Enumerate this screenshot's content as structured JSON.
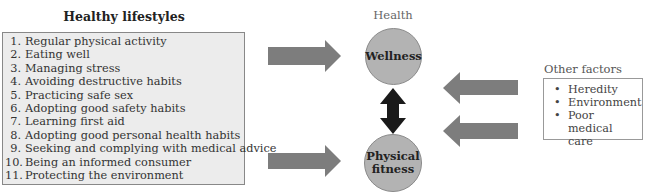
{
  "healthy_lifestyles": {
    "title": "Healthy lifestyles",
    "items": [
      {
        "num": "1.",
        "label": "Regular physical activity"
      },
      {
        "num": "2.",
        "label": "Eating well"
      },
      {
        "num": "3.",
        "label": "Managing stress"
      },
      {
        "num": "4.",
        "label": "Avoiding destructive habits"
      },
      {
        "num": "5.",
        "label": "Practicing safe sex"
      },
      {
        "num": "6.",
        "label": "Adopting good safety habits"
      },
      {
        "num": "7.",
        "label": "Learning first aid"
      },
      {
        "num": "8.",
        "label": "Adopting good personal health habits"
      },
      {
        "num": "9.",
        "label": "Seeking and complying with medical advice"
      },
      {
        "num": "10.",
        "label": "Being an informed consumer"
      },
      {
        "num": "11.",
        "label": "Protecting the environment"
      }
    ]
  },
  "health": {
    "label": "Health",
    "wellness": "Wellness",
    "physical_fitness_line1": "Physical",
    "physical_fitness_line2": "fitness"
  },
  "other_factors": {
    "title": "Other factors",
    "bullet": "•",
    "items": [
      {
        "label": "Heredity"
      },
      {
        "label": "Environment"
      },
      {
        "label": "Poor medical care"
      }
    ]
  },
  "colors": {
    "arrow_gray": "#7d7d7d",
    "double_arrow": "#1a1a1a",
    "circle_fill": "#b3b3b3",
    "box_fill": "#ececec"
  }
}
